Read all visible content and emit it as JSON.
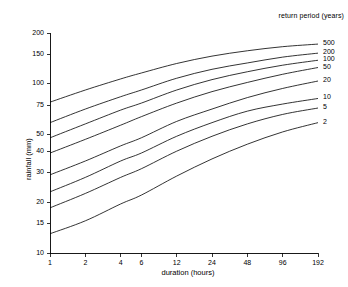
{
  "chart_data": {
    "type": "line",
    "title": "",
    "xlabel": "duration (hours)",
    "ylabel": "rainfall (mm)",
    "xscale": "log",
    "yscale": "log",
    "xlim": [
      1,
      192
    ],
    "ylim": [
      10,
      200
    ],
    "grid": false,
    "legend_title": "return period (years)",
    "legend_position": "right-of-plot-curve-ends",
    "xticks": [
      1,
      2,
      4,
      6,
      12,
      24,
      48,
      96,
      192
    ],
    "xticklabels": [
      "1",
      "2",
      "4",
      "6",
      "12",
      "24",
      "48",
      "96",
      "192"
    ],
    "yticks": [
      10,
      15,
      20,
      30,
      40,
      50,
      75,
      100,
      150,
      200
    ],
    "yticklabels": [
      "10",
      "15",
      "20",
      "30",
      "40",
      "50",
      "75",
      "100",
      "150",
      "200"
    ],
    "x": [
      1,
      2,
      4,
      6,
      12,
      24,
      48,
      96,
      192
    ],
    "series": [
      {
        "name": "500",
        "label": "500",
        "values": [
          78,
          92,
          107,
          116,
          132,
          146,
          157,
          166,
          172
        ]
      },
      {
        "name": "200",
        "label": "200",
        "values": [
          59,
          71,
          84,
          92,
          108,
          122,
          133,
          144,
          152
        ]
      },
      {
        "name": "100",
        "label": "100",
        "values": [
          48,
          58,
          70,
          77,
          92,
          106,
          118,
          129,
          138
        ]
      },
      {
        "name": "50",
        "label": "50",
        "values": [
          39,
          47,
          57,
          64,
          77,
          90,
          102,
          114,
          125
        ]
      },
      {
        "name": "20",
        "label": "20",
        "values": [
          29,
          35,
          43,
          48,
          60,
          71,
          83,
          94,
          104
        ]
      },
      {
        "name": "10",
        "label": "10",
        "values": [
          23,
          28,
          35,
          39,
          49,
          59,
          69,
          76,
          82
        ]
      },
      {
        "name": "5",
        "label": "5",
        "values": [
          18.5,
          22.5,
          28,
          31.5,
          40,
          49,
          58,
          66,
          72
        ]
      },
      {
        "name": "2",
        "label": "2",
        "values": [
          13,
          15.5,
          19.5,
          22,
          28.5,
          36,
          44,
          52,
          59
        ]
      }
    ]
  },
  "axes": {
    "x_title": "duration (hours)",
    "y_title": "rainfall (mm)"
  },
  "legend": {
    "title": "return period (years)"
  }
}
